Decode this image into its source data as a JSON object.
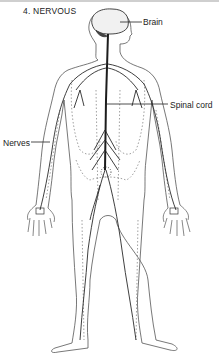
{
  "diagram": {
    "title": "4. NERVOUS",
    "labels": {
      "brain": "Brain",
      "spinal_cord": "Spinal cord",
      "nerves": "Nerves"
    },
    "colors": {
      "ink": "#222222",
      "outline": "#555555",
      "dotted": "#777777",
      "background": "#ffffff"
    }
  }
}
